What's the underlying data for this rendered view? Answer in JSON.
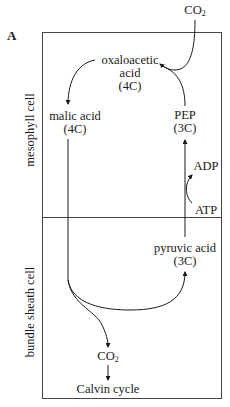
{
  "figure": {
    "panel_label": "A",
    "regions": {
      "top": "mesophyll cell",
      "bottom": "bundle sheath cell"
    },
    "nodes": {
      "co2_in": {
        "main": "CO",
        "sub": "2"
      },
      "oxaloacetic": {
        "line1": "oxaloacetic",
        "line2": "acid",
        "line3": "(4C)"
      },
      "malic": {
        "line1": "malic acid",
        "line2": "(4C)"
      },
      "pep": {
        "line1": "PEP",
        "line2": "(3C)"
      },
      "adp": "ADP",
      "atp": "ATP",
      "pyruvic": {
        "line1": "pyruvic acid",
        "line2": "(3C)"
      },
      "co2_out": {
        "main": "CO",
        "sub": "2"
      },
      "calvin": "Calvin cycle"
    },
    "colors": {
      "line": "#1a1a1a",
      "box": "#444444",
      "background": "#ffffff"
    }
  }
}
